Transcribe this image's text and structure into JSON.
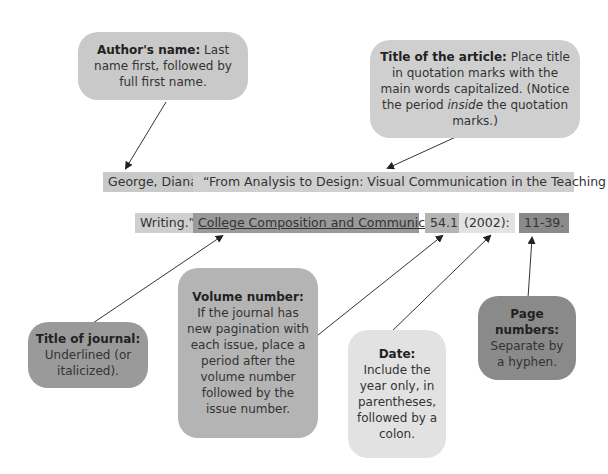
{
  "citation": {
    "line1": [
      {
        "id": "author",
        "text": "George, Diana.",
        "color": "#c9c9c9"
      },
      {
        "id": "article-title-1",
        "text": "“From Analysis to Design: Visual Communication in the Teaching of",
        "color": "#cfcfcf"
      }
    ],
    "line2": [
      {
        "id": "article-title-2",
        "text": "Writing.”",
        "color": "#cfcfcf"
      },
      {
        "id": "journal-title",
        "text": "College Composition and Communication",
        "color": "#9a9a9a"
      },
      {
        "id": "volume",
        "text": "54.1",
        "color": "#b4b4b4"
      },
      {
        "id": "date",
        "text": "(2002):",
        "color": "#e2e2e2"
      },
      {
        "id": "pages",
        "text": "11-39.",
        "color": "#8a8a8a"
      }
    ]
  },
  "callouts": {
    "author": {
      "label": "Author's name:",
      "body": "Last name first, followed by full first name.",
      "color": "#c9c9c9"
    },
    "article": {
      "label": "Title of the article:",
      "body": "Place title in quotation marks with the main words capitalized. (Notice the period",
      "italic": "inside",
      "body_end": "the quotation marks.)",
      "color": "#cfcfcf"
    },
    "journal": {
      "label": "Title of journal:",
      "body": "Underlined (or italicized).",
      "color": "#9a9a9a"
    },
    "volume": {
      "label": "Volume number:",
      "body": "If the journal has new pagination with each issue, place a period after the volume number followed by the issue number.",
      "color": "#b4b4b4"
    },
    "date": {
      "label": "Date:",
      "body": "Include the year only, in parentheses, followed by a colon.",
      "color": "#e2e2e2"
    },
    "pages": {
      "label": "Page numbers:",
      "body": "Separate by a hyphen.",
      "color": "#8a8a8a"
    }
  }
}
